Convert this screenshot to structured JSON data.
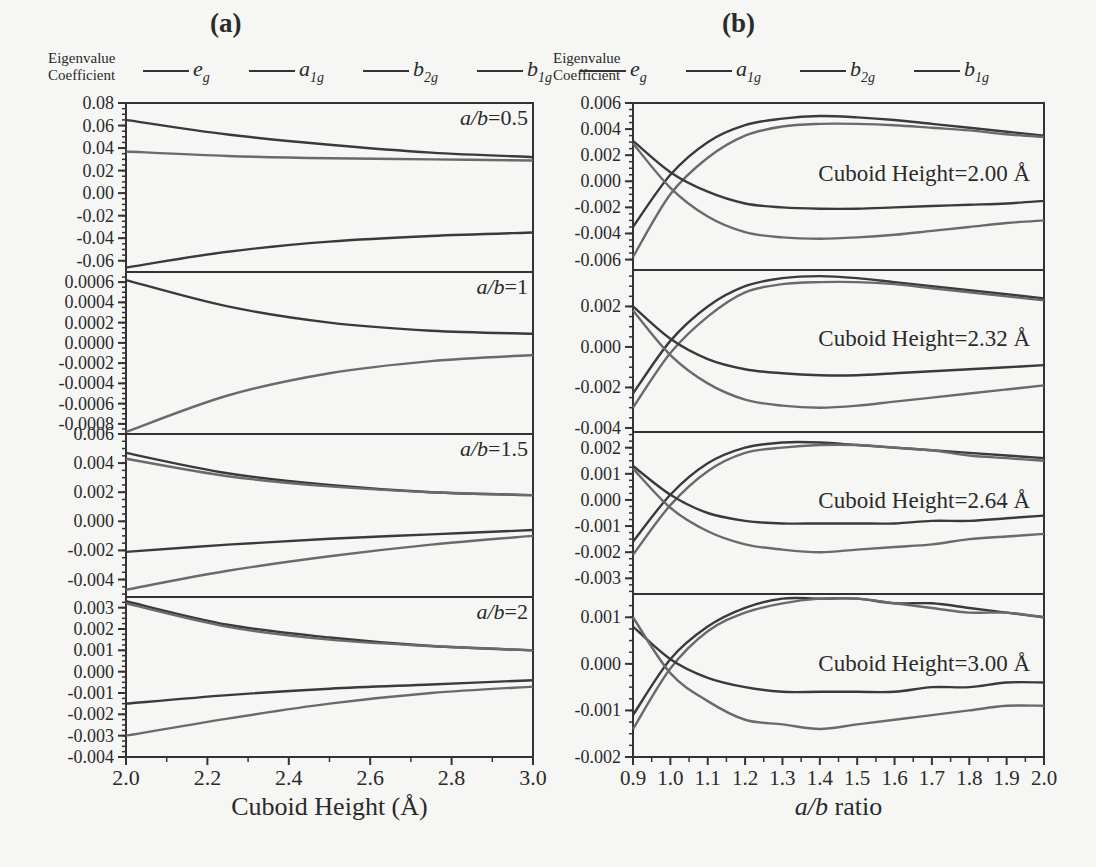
{
  "figure": {
    "panels": [
      {
        "id": "a",
        "label": "(a)"
      },
      {
        "id": "b",
        "label": "(b)"
      }
    ],
    "legend": {
      "title_line1": "Eigenvalue",
      "title_line2": "Coefficient",
      "entries": [
        {
          "base": "e",
          "sub": "g"
        },
        {
          "base": "a",
          "sub": "1g"
        },
        {
          "base": "b",
          "sub": "2g"
        },
        {
          "base": "b",
          "sub": "1g"
        }
      ]
    }
  },
  "chart_data": [
    {
      "panel": "(a)",
      "type": "line",
      "xlabel": "Cuboid Height (Å)",
      "ylabel": "Eigenvalue Coefficient",
      "xlim": [
        2.0,
        3.0
      ],
      "x_ticks": [
        "2.0",
        "2.2",
        "2.4",
        "2.6",
        "2.8",
        "3.0"
      ],
      "legend": [
        "e_g",
        "a_1g",
        "b_2g",
        "b_1g"
      ],
      "subplots": [
        {
          "annotation": "a/b=0.5",
          "ylim": [
            -0.07,
            0.08
          ],
          "y_ticks": [
            "0.08",
            "0.06",
            "0.04",
            "0.02",
            "0.00",
            "-0.02",
            "-0.04",
            "-0.06"
          ],
          "x": [
            2.0,
            2.25,
            2.5,
            2.75,
            3.0
          ],
          "series": [
            {
              "name": "curve1",
              "values": [
                0.065,
                0.052,
                0.043,
                0.036,
                0.032
              ]
            },
            {
              "name": "curve2",
              "values": [
                0.037,
                0.033,
                0.031,
                0.03,
                0.029
              ]
            },
            {
              "name": "curve3",
              "values": [
                -0.066,
                -0.052,
                -0.043,
                -0.038,
                -0.035
              ]
            }
          ]
        },
        {
          "annotation": "a/b=1",
          "ylim": [
            -0.0009,
            0.0007
          ],
          "y_ticks": [
            "0.0006",
            "0.0004",
            "0.0002",
            "0.0000",
            "-0.0002",
            "-0.0004",
            "-0.0006",
            "-0.0008"
          ],
          "x": [
            2.0,
            2.25,
            2.5,
            2.75,
            3.0
          ],
          "series": [
            {
              "name": "curve1",
              "values": [
                0.00062,
                0.00036,
                0.0002,
                0.00012,
                9e-05
              ]
            },
            {
              "name": "curve2",
              "values": [
                -0.00088,
                -0.00052,
                -0.0003,
                -0.00018,
                -0.00012
              ]
            }
          ]
        },
        {
          "annotation": "a/b=1.5",
          "ylim": [
            -0.0052,
            0.006
          ],
          "y_ticks": [
            "0.006",
            "0.004",
            "0.002",
            "0.000",
            "-0.002",
            "-0.004"
          ],
          "x": [
            2.0,
            2.25,
            2.5,
            2.75,
            3.0
          ],
          "series": [
            {
              "name": "curve1",
              "values": [
                0.0047,
                0.0033,
                0.0025,
                0.002,
                0.0018
              ]
            },
            {
              "name": "curve2",
              "values": [
                0.0043,
                0.0031,
                0.0024,
                0.002,
                0.0018
              ]
            },
            {
              "name": "curve3",
              "values": [
                -0.0021,
                -0.0016,
                -0.0012,
                -0.0009,
                -0.0006
              ]
            },
            {
              "name": "curve4",
              "values": [
                -0.0047,
                -0.0034,
                -0.0024,
                -0.0016,
                -0.001
              ]
            }
          ]
        },
        {
          "annotation": "a/b=2",
          "ylim": [
            -0.004,
            0.0035
          ],
          "y_ticks": [
            "0.003",
            "0.002",
            "0.001",
            "0.000",
            "-0.001",
            "-0.002",
            "-0.003",
            "-0.004"
          ],
          "x": [
            2.0,
            2.25,
            2.5,
            2.75,
            3.0
          ],
          "series": [
            {
              "name": "curve1",
              "values": [
                0.0033,
                0.0022,
                0.0016,
                0.0012,
                0.001
              ]
            },
            {
              "name": "curve2",
              "values": [
                0.0032,
                0.0021,
                0.0015,
                0.0012,
                0.001
              ]
            },
            {
              "name": "curve3",
              "values": [
                -0.0015,
                -0.0011,
                -0.0008,
                -0.0006,
                -0.0004
              ]
            },
            {
              "name": "curve4",
              "values": [
                -0.003,
                -0.0022,
                -0.0015,
                -0.001,
                -0.0007
              ]
            }
          ]
        }
      ]
    },
    {
      "panel": "(b)",
      "type": "line",
      "xlabel": "a/b ratio",
      "ylabel": "Eigenvalue Coefficient",
      "xlim": [
        0.9,
        2.0
      ],
      "x_ticks": [
        "0.9",
        "1.0",
        "1.1",
        "1.2",
        "1.3",
        "1.4",
        "1.5",
        "1.6",
        "1.7",
        "1.8",
        "1.9",
        "2.0"
      ],
      "legend": [
        "e_g",
        "a_1g",
        "b_2g",
        "b_1g"
      ],
      "subplots": [
        {
          "annotation": "Cuboid Height=2.00 Å",
          "ylim": [
            -0.0068,
            0.006
          ],
          "y_ticks": [
            "0.006",
            "0.004",
            "0.002",
            "0.000",
            "-0.002",
            "-0.004",
            "-0.006"
          ],
          "x": [
            0.9,
            1.0,
            1.1,
            1.2,
            1.3,
            1.4,
            1.5,
            1.6,
            1.7,
            1.8,
            1.9,
            2.0
          ],
          "series": [
            {
              "name": "curve1",
              "values": [
                -0.0035,
                0.0005,
                0.003,
                0.0043,
                0.0048,
                0.005,
                0.0049,
                0.0047,
                0.0044,
                0.0041,
                0.0038,
                0.0035
              ]
            },
            {
              "name": "curve2",
              "values": [
                -0.0058,
                -0.001,
                0.0018,
                0.0035,
                0.0042,
                0.0044,
                0.0044,
                0.0043,
                0.0041,
                0.0039,
                0.0036,
                0.0034
              ]
            },
            {
              "name": "curve3",
              "values": [
                0.0031,
                0.0007,
                -0.0008,
                -0.0017,
                -0.002,
                -0.0021,
                -0.0021,
                -0.002,
                -0.0019,
                -0.0018,
                -0.0017,
                -0.0015
              ]
            },
            {
              "name": "curve4",
              "values": [
                0.0029,
                -0.0005,
                -0.0027,
                -0.0039,
                -0.0043,
                -0.0044,
                -0.0043,
                -0.0041,
                -0.0038,
                -0.0035,
                -0.0032,
                -0.003
              ]
            }
          ]
        },
        {
          "annotation": "Cuboid Height=2.32 Å",
          "ylim": [
            -0.0042,
            0.0038
          ],
          "y_ticks": [
            "0.002",
            "0.000",
            "-0.002",
            "-0.004"
          ],
          "x": [
            0.9,
            1.0,
            1.1,
            1.2,
            1.3,
            1.4,
            1.5,
            1.6,
            1.7,
            1.8,
            1.9,
            2.0
          ],
          "series": [
            {
              "name": "curve1",
              "values": [
                -0.0023,
                0.0003,
                0.002,
                0.003,
                0.0034,
                0.0035,
                0.0034,
                0.0032,
                0.003,
                0.0028,
                0.0026,
                0.0024
              ]
            },
            {
              "name": "curve2",
              "values": [
                -0.003,
                -0.0003,
                0.0015,
                0.0027,
                0.0031,
                0.0032,
                0.0032,
                0.0031,
                0.0029,
                0.0027,
                0.0025,
                0.0023
              ]
            },
            {
              "name": "curve3",
              "values": [
                0.002,
                0.0004,
                -0.0006,
                -0.0011,
                -0.0013,
                -0.0014,
                -0.0014,
                -0.0013,
                -0.0012,
                -0.0011,
                -0.001,
                -0.0009
              ]
            },
            {
              "name": "curve4",
              "values": [
                0.0018,
                -0.0004,
                -0.0018,
                -0.0026,
                -0.0029,
                -0.003,
                -0.0029,
                -0.0027,
                -0.0025,
                -0.0023,
                -0.0021,
                -0.0019
              ]
            }
          ]
        },
        {
          "annotation": "Cuboid Height=2.64 Å",
          "ylim": [
            -0.0036,
            0.0026
          ],
          "y_ticks": [
            "0.002",
            "0.001",
            "0.000",
            "-0.001",
            "-0.002",
            "-0.003"
          ],
          "x": [
            0.9,
            1.0,
            1.1,
            1.2,
            1.3,
            1.4,
            1.5,
            1.6,
            1.7,
            1.8,
            1.9,
            2.0
          ],
          "series": [
            {
              "name": "curve1",
              "values": [
                -0.0016,
                0.0002,
                0.0014,
                0.002,
                0.0022,
                0.0022,
                0.0021,
                0.002,
                0.0019,
                0.0018,
                0.0017,
                0.0016
              ]
            },
            {
              "name": "curve2",
              "values": [
                -0.0021,
                -0.0002,
                0.0011,
                0.0018,
                0.002,
                0.0021,
                0.0021,
                0.002,
                0.0019,
                0.0017,
                0.0016,
                0.0015
              ]
            },
            {
              "name": "curve3",
              "values": [
                0.0013,
                0.0002,
                -0.0005,
                -0.0008,
                -0.0009,
                -0.0009,
                -0.0009,
                -0.0009,
                -0.0008,
                -0.0008,
                -0.0007,
                -0.0006
              ]
            },
            {
              "name": "curve4",
              "values": [
                0.0012,
                -0.0003,
                -0.0012,
                -0.0017,
                -0.0019,
                -0.002,
                -0.0019,
                -0.0018,
                -0.0017,
                -0.0015,
                -0.0014,
                -0.0013
              ]
            }
          ]
        },
        {
          "annotation": "Cuboid Height=3.00 Å",
          "ylim": [
            -0.002,
            0.0015
          ],
          "y_ticks": [
            "0.001",
            "0.000",
            "-0.001",
            "-0.002"
          ],
          "x": [
            0.9,
            1.0,
            1.1,
            1.2,
            1.3,
            1.4,
            1.5,
            1.6,
            1.7,
            1.8,
            1.9,
            2.0
          ],
          "series": [
            {
              "name": "curve1",
              "values": [
                -0.0011,
                0.0001,
                0.0008,
                0.0012,
                0.0014,
                0.0014,
                0.0014,
                0.0013,
                0.0013,
                0.0012,
                0.0011,
                0.001
              ]
            },
            {
              "name": "curve2",
              "values": [
                -0.0014,
                -0.0001,
                0.0007,
                0.0011,
                0.0013,
                0.0014,
                0.0014,
                0.0013,
                0.0012,
                0.0011,
                0.0011,
                0.001
              ]
            },
            {
              "name": "curve3",
              "values": [
                0.0008,
                0.0001,
                -0.0003,
                -0.0005,
                -0.0006,
                -0.0006,
                -0.0006,
                -0.0006,
                -0.0005,
                -0.0005,
                -0.0004,
                -0.0004
              ]
            },
            {
              "name": "curve4",
              "values": [
                0.001,
                -0.0002,
                -0.0008,
                -0.0012,
                -0.0013,
                -0.0014,
                -0.0013,
                -0.0012,
                -0.0011,
                -0.001,
                -0.0009,
                -0.0009
              ]
            }
          ]
        }
      ]
    }
  ]
}
